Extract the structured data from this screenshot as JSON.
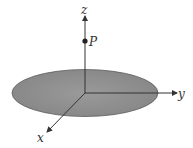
{
  "diagram": {
    "axes": {
      "x": {
        "label": "x"
      },
      "y": {
        "label": "y"
      },
      "z": {
        "label": "z"
      }
    },
    "point": {
      "label": "P"
    },
    "colors": {
      "disk_fill": "#8f8f8f",
      "disk_stroke": "#555555",
      "axis": "#333333",
      "background": "#ffffff"
    }
  }
}
